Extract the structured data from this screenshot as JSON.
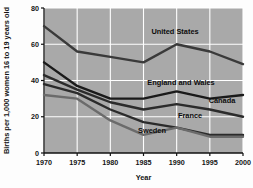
{
  "chart_data": {
    "type": "line",
    "title": "",
    "xlabel": "Year",
    "ylabel": "Births per 1,000 women 16 to 19 years old",
    "x": [
      1970,
      1975,
      1980,
      1985,
      1990,
      1995,
      2000
    ],
    "categories": [
      "1970",
      "1975",
      "1980",
      "1985",
      "1990",
      "1995",
      "2000"
    ],
    "xlim": [
      1970,
      2000
    ],
    "ylim": [
      0,
      80
    ],
    "yticks": [
      0,
      20,
      40,
      60,
      80
    ],
    "ytick_labels": [
      "0",
      "20",
      "40",
      "60",
      "80"
    ],
    "xticks": [
      1970,
      1975,
      1980,
      1985,
      1990,
      1995,
      2000
    ],
    "xtick_labels": [
      "1970",
      "1975",
      "1980",
      "1985",
      "1990",
      "1995",
      "2000"
    ],
    "grid": true,
    "grid_color": "#ffffff",
    "plot_background": "#a9a9a9",
    "figure_background": "#fdfdfd",
    "legend": "inline-annotations",
    "series": [
      {
        "name": "United States",
        "label": "United States",
        "color": "#3a3a3a",
        "values": [
          70,
          56,
          53,
          50,
          60,
          56,
          49
        ]
      },
      {
        "name": "England and Wales",
        "label": "England and Wales",
        "color": "#1a1a1a",
        "values": [
          50,
          37,
          30,
          30,
          34,
          30,
          32
        ]
      },
      {
        "name": "Canada",
        "label": "Canada",
        "color": "#2b2b2b",
        "values": [
          43,
          35,
          28,
          24,
          27,
          24,
          20
        ]
      },
      {
        "name": "France",
        "label": "France",
        "color": "#2b2b2b",
        "values": [
          38,
          33,
          24,
          17,
          14,
          10,
          10
        ]
      },
      {
        "name": "Sweden",
        "label": "Sweden",
        "color": "#6b6b6b",
        "values": [
          32,
          30,
          18,
          10,
          14,
          9,
          9
        ]
      }
    ],
    "annotations": [
      {
        "text": "United States",
        "x_px": 175,
        "y_px": 34
      },
      {
        "text": "England and Wales",
        "x_px": 181,
        "y_px": 85
      },
      {
        "text": "Canada",
        "x_px": 222,
        "y_px": 103
      },
      {
        "text": "France",
        "x_px": 190,
        "y_px": 118
      },
      {
        "text": "Sweden",
        "x_px": 152,
        "y_px": 133
      }
    ]
  }
}
